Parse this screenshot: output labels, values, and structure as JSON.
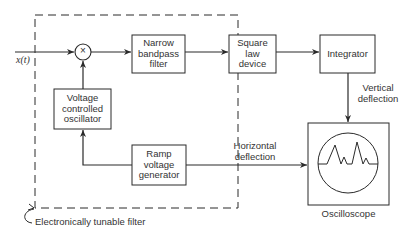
{
  "diagram": {
    "input_signal": "x(t)",
    "multiplier_symbol": "×",
    "blocks": {
      "narrow_bandpass_filter": "Narrow\nbandpass\nfilter",
      "square_law_device": "Square\nlaw\ndevice",
      "integrator": "Integrator",
      "voltage_controlled_oscillator": "Voltage\ncontrolled\noscillator",
      "ramp_voltage_generator": "Ramp\nvoltage\ngenerator",
      "oscilloscope": "Oscilloscope"
    },
    "edge_labels": {
      "vertical_deflection": "Vertical\ndeflection",
      "horizontal_deflection": "Horizontal\ndeflection"
    },
    "group_label": "Electronically tunable filter",
    "colors": {
      "line": "#2a2a2a",
      "background": "#ffffff"
    }
  }
}
